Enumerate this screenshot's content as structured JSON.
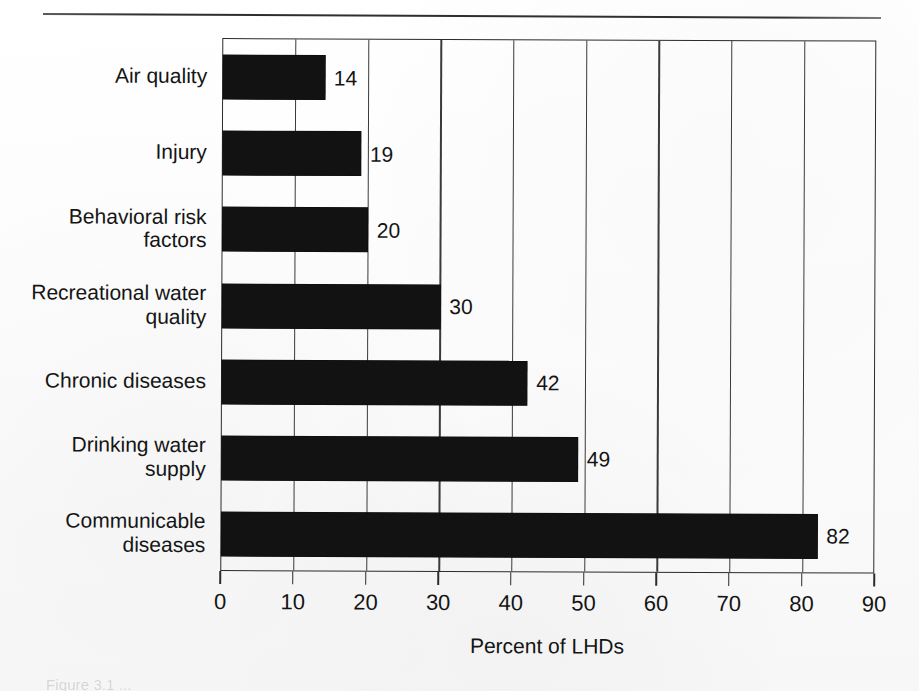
{
  "figure": {
    "background_color": "#ffffff",
    "bar_color": "#121212",
    "axis_color": "#2b2b2b",
    "top_rule": "horizontal-rule",
    "caption": "Figure 3.1 ..."
  },
  "chart_data": {
    "type": "bar",
    "orientation": "horizontal",
    "title": "",
    "subtitle": "",
    "xlabel": "Percent of LHDs",
    "ylabel": "",
    "categories": [
      "Air quality",
      "Injury",
      "Behavioral risk factors",
      "Recreational water quality",
      "Chronic diseases",
      "Drinking water supply",
      "Communicable diseases"
    ],
    "category_lines": [
      [
        "Air quality"
      ],
      [
        "Injury"
      ],
      [
        "Behavioral risk",
        "factors"
      ],
      [
        "Recreational water",
        "quality"
      ],
      [
        "Chronic diseases"
      ],
      [
        "Drinking water",
        "supply"
      ],
      [
        "Communicable",
        "diseases"
      ]
    ],
    "values": [
      14,
      19,
      20,
      30,
      42,
      49,
      82
    ],
    "value_labels": [
      "14",
      "19",
      "20",
      "30",
      "42",
      "49",
      "82"
    ],
    "xlim": [
      0,
      90
    ],
    "xticks": [
      0,
      10,
      20,
      30,
      40,
      50,
      60,
      70,
      80,
      90
    ],
    "xtick_labels": [
      "0",
      "10",
      "20",
      "30",
      "40",
      "50",
      "60",
      "70",
      "80",
      "90"
    ],
    "grid": "vertical",
    "legend": "none",
    "series": [
      {
        "name": "Percent of LHDs",
        "values": [
          14,
          19,
          20,
          30,
          42,
          49,
          82
        ]
      }
    ]
  }
}
